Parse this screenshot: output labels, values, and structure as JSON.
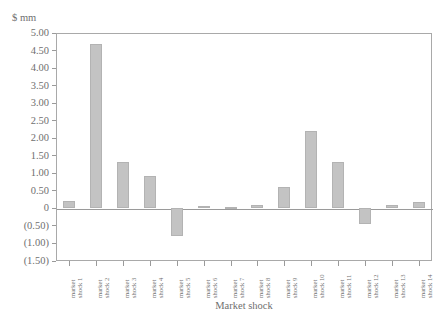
{
  "header": {
    "clipped_text": ""
  },
  "axes": {
    "y_title": "$ mm",
    "x_title": "Market shock",
    "y_ticks": [
      "5.00",
      "4.50",
      "4.00",
      "3.50",
      "3.00",
      "2.50",
      "2.00",
      "1.50",
      "1.00",
      "0.50",
      "0",
      "(0.50)",
      "(1.00)",
      "(1.50)"
    ]
  },
  "style": {
    "bar_fill": "#c3c3c3",
    "bar_stroke": "#b3b3b3",
    "axis_color": "#9a9a9a",
    "text_color": "#6f6f6f",
    "background": "#ffffff"
  },
  "chart_data": {
    "type": "bar",
    "title": "",
    "xlabel": "Market shock",
    "ylabel": "$ mm",
    "ylim": [
      -1.5,
      5.0
    ],
    "ytick_values": [
      5.0,
      4.5,
      4.0,
      3.5,
      3.0,
      2.5,
      2.0,
      1.5,
      1.0,
      0.5,
      0.0,
      -0.5,
      -1.0,
      -1.5
    ],
    "ytick_labels": [
      "5.00",
      "4.50",
      "4.00",
      "3.50",
      "3.00",
      "2.50",
      "2.00",
      "1.50",
      "1.00",
      "0.50",
      "0",
      "(0.50)",
      "(1.00)",
      "(1.50)"
    ],
    "grid": false,
    "legend": "none",
    "categories": [
      "market shock 1",
      "market shock 2",
      "market shock 3",
      "market shock 4",
      "market shock 5",
      "market shock 6",
      "market shock 7",
      "market shock 8",
      "market shock 9",
      "market shock 10",
      "market shock 11",
      "market shock 12",
      "market shock 13",
      "market shock 14"
    ],
    "category_lines": [
      [
        "market",
        "shock 1"
      ],
      [
        "market",
        "shock 2"
      ],
      [
        "market",
        "shock 3"
      ],
      [
        "market",
        "shock 4"
      ],
      [
        "market",
        "shock 5"
      ],
      [
        "market",
        "shock 6"
      ],
      [
        "market",
        "shock 7"
      ],
      [
        "market",
        "shock 8"
      ],
      [
        "market",
        "shock 9"
      ],
      [
        "market",
        "shock 10"
      ],
      [
        "market",
        "shock 11"
      ],
      [
        "market",
        "shock 12"
      ],
      [
        "market",
        "shock 13"
      ],
      [
        "market",
        "shock 14"
      ]
    ],
    "values": [
      0.22,
      4.69,
      1.31,
      0.91,
      -0.8,
      0.08,
      0.04,
      0.1,
      0.6,
      2.22,
      1.31,
      -0.45,
      0.1,
      0.18
    ]
  }
}
